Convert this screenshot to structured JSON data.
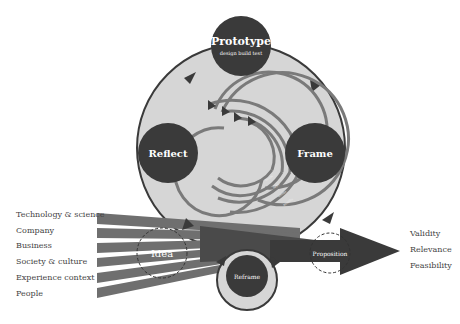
{
  "colors": {
    "dark": "#3a3a3a",
    "circle_fill": "#d6d6d6",
    "outline": "#3a3a3a",
    "band": "#6f6f6f",
    "arcs": "#7a7a7a",
    "text": "#444444"
  },
  "nodes": {
    "prototype": {
      "title": "Prototype",
      "subtitle": "design build test"
    },
    "reflect": {
      "title": "Reflect"
    },
    "frame": {
      "title": "Frame"
    },
    "reframe": {
      "title": "Reframe"
    },
    "idea": {
      "title": "Idea"
    },
    "proposition": {
      "title": "Proposition"
    }
  },
  "inputs": [
    "Technology & science",
    "Company",
    "Business",
    "Society & culture",
    "Experience context",
    "People"
  ],
  "outputs": [
    "Validity",
    "Relevance",
    "Feasibility"
  ],
  "cycle_arcs": [
    "hours",
    "days",
    "weeks",
    "months"
  ]
}
